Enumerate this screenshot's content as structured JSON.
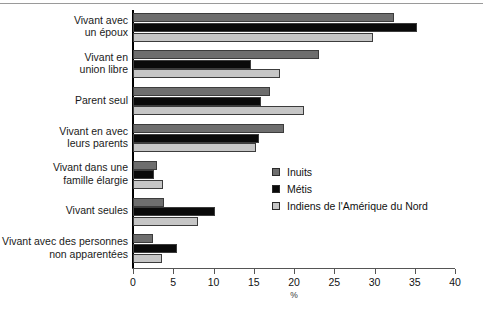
{
  "chart_data": {
    "type": "bar",
    "orientation": "horizontal",
    "title": "",
    "xlabel": "%",
    "ylabel": "",
    "xlim": [
      0,
      40
    ],
    "xticks": [
      0,
      5,
      10,
      15,
      20,
      25,
      30,
      35,
      40
    ],
    "grid": false,
    "legend_position": "center-right",
    "categories": [
      "Vivant avec un époux",
      "Vivant en union libre",
      "Parent seul",
      "Vivant en avec leurs parents",
      "Vivant dans une famille élargie",
      "Vivant seules",
      "Vivant avec des personnes non apparentées"
    ],
    "category_lines": [
      [
        "Vivant avec",
        "un époux"
      ],
      [
        "Vivant en",
        "union libre"
      ],
      [
        "Parent seul"
      ],
      [
        "Vivant en avec",
        "leurs parents"
      ],
      [
        "Vivant dans une",
        "famille élargie"
      ],
      [
        "Vivant seules"
      ],
      [
        "Vivant avec des personnes",
        "non apparentées"
      ]
    ],
    "series": [
      {
        "name": "Inuits",
        "color": "#6e6e6e",
        "values": [
          32.4,
          23.1,
          17.0,
          18.7,
          3.0,
          3.9,
          2.5
        ]
      },
      {
        "name": "Métis",
        "color": "#0a0a0a",
        "values": [
          35.3,
          14.7,
          15.9,
          15.7,
          2.6,
          10.2,
          5.5
        ]
      },
      {
        "name": "Indiens de l'Amérique du Nord",
        "color": "#c6c6c6",
        "values": [
          29.8,
          18.2,
          21.3,
          15.3,
          3.7,
          8.1,
          3.6
        ]
      }
    ]
  },
  "footnote": ""
}
